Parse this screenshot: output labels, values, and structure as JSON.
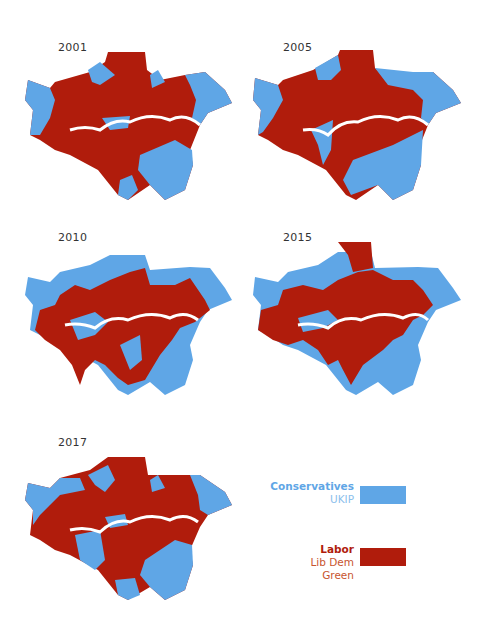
{
  "colors": {
    "conservative": "#5fa6e6",
    "labour": "#b01c0c",
    "border": "#f2c7b8",
    "river": "#ffffff",
    "year_text": "#333333",
    "legend_blue_text": "#5fa6e6",
    "legend_red_title": "#b01c0c",
    "legend_red_text": "#c8552f"
  },
  "maps": [
    {
      "year": "2001",
      "labour_share": "high"
    },
    {
      "year": "2005",
      "labour_share": "medium-high"
    },
    {
      "year": "2010",
      "labour_share": "medium"
    },
    {
      "year": "2015",
      "labour_share": "medium"
    },
    {
      "year": "2017",
      "labour_share": "medium-high"
    }
  ],
  "legend": {
    "blue": {
      "title": "Conservatives",
      "items": [
        "UKIP"
      ]
    },
    "red": {
      "title": "Labor",
      "items": [
        "Lib Dem",
        "Green"
      ]
    }
  }
}
